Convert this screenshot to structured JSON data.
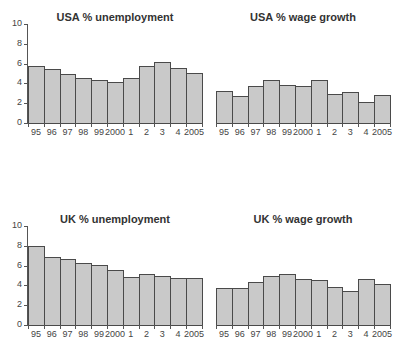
{
  "chart_data": [
    {
      "type": "bar",
      "title": "USA % unemployment",
      "categories": [
        "95",
        "96",
        "97",
        "98",
        "99",
        "2000",
        "1",
        "2",
        "3",
        "4",
        "2005"
      ],
      "values": [
        5.8,
        5.5,
        4.9,
        4.5,
        4.3,
        4.1,
        4.5,
        5.8,
        6.2,
        5.6,
        5.1
      ],
      "xlabel": "",
      "ylabel": "",
      "ylim": [
        0,
        10
      ],
      "yticks": [
        "0",
        "2",
        "4",
        "6",
        "8",
        "10"
      ],
      "y_axis_visible": true,
      "grid": false
    },
    {
      "type": "bar",
      "title": "USA % wage growth",
      "categories": [
        "95",
        "96",
        "97",
        "98",
        "99",
        "2000",
        "1",
        "2",
        "3",
        "4",
        "2005"
      ],
      "values": [
        3.2,
        2.7,
        3.7,
        4.3,
        3.8,
        3.7,
        4.3,
        2.9,
        3.1,
        2.1,
        2.8
      ],
      "xlabel": "",
      "ylabel": "",
      "ylim": [
        0,
        10
      ],
      "y_axis_visible": false,
      "grid": false
    },
    {
      "type": "bar",
      "title": "UK % unemployment",
      "categories": [
        "95",
        "96",
        "97",
        "98",
        "99",
        "2000",
        "1",
        "2",
        "3",
        "4",
        "2005"
      ],
      "values": [
        8.0,
        6.9,
        6.7,
        6.3,
        6.1,
        5.6,
        4.8,
        5.2,
        4.9,
        4.7,
        4.7
      ],
      "xlabel": "",
      "ylabel": "",
      "ylim": [
        0,
        10
      ],
      "yticks": [
        "0",
        "2",
        "4",
        "6",
        "8",
        "10"
      ],
      "y_axis_visible": true,
      "grid": false
    },
    {
      "type": "bar",
      "title": "UK % wage growth",
      "categories": [
        "95",
        "96",
        "97",
        "98",
        "99",
        "2000",
        "1",
        "2",
        "3",
        "4",
        "2005"
      ],
      "values": [
        3.7,
        3.7,
        4.3,
        5.0,
        5.2,
        4.6,
        4.5,
        3.8,
        3.4,
        4.6,
        4.1
      ],
      "xlabel": "",
      "ylabel": "",
      "ylim": [
        0,
        10
      ],
      "y_axis_visible": false,
      "grid": false
    }
  ],
  "colors": {
    "bar_fill": "#c9c9c9",
    "bar_border": "#4a4a4a",
    "axis": "#555555",
    "text": "#333333"
  }
}
